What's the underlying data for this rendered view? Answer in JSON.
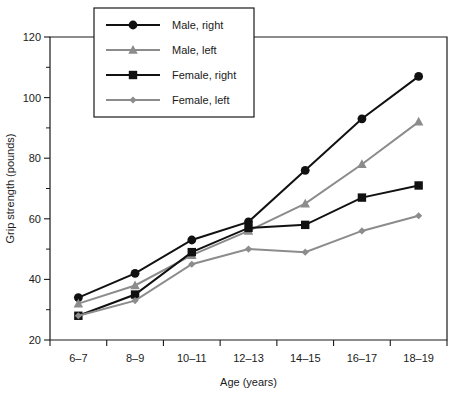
{
  "chart_data": {
    "type": "line",
    "title": "",
    "xlabel": "Age (years)",
    "ylabel": "Grip strength (pounds)",
    "categories": [
      "6–7",
      "8–9",
      "10–11",
      "12–13",
      "14–15",
      "16–17",
      "18–19"
    ],
    "ylim": [
      20,
      120
    ],
    "ytick_labels": [
      "20",
      "40",
      "60",
      "80",
      "100",
      "120"
    ],
    "ytick_values": [
      20,
      40,
      60,
      80,
      100,
      120
    ],
    "yminor_values": [
      30,
      50,
      70,
      90,
      110
    ],
    "grid": false,
    "legend_position": "top-left-inside",
    "series": [
      {
        "name": "Male, right",
        "marker": "circle",
        "color": "#111111",
        "values": [
          34,
          42,
          53,
          59,
          76,
          93,
          107
        ]
      },
      {
        "name": "Male, left",
        "marker": "triangle",
        "color": "#8c8c8c",
        "values": [
          32,
          38,
          48,
          56,
          65,
          78,
          92
        ]
      },
      {
        "name": "Female, right",
        "marker": "square",
        "color": "#111111",
        "values": [
          28,
          35,
          49,
          57,
          58,
          67,
          71
        ]
      },
      {
        "name": "Female, left",
        "marker": "diamond",
        "color": "#8c8c8c",
        "values": [
          28,
          33,
          45,
          50,
          49,
          56,
          61
        ]
      }
    ]
  },
  "legend": {
    "items": [
      {
        "label": "Male, right"
      },
      {
        "label": "Male, left"
      },
      {
        "label": "Female, right"
      },
      {
        "label": "Female, left"
      }
    ]
  },
  "colors": {
    "series_right": "#111111",
    "series_left": "#8c8c8c",
    "axis": "#1a1a1a",
    "background": "#ffffff"
  }
}
